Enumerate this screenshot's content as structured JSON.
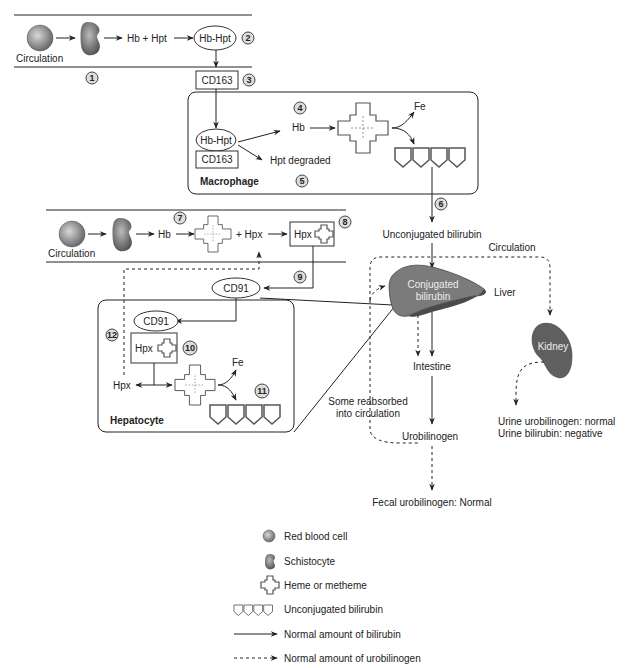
{
  "top_pathway": {
    "circulation_label": "Circulation",
    "hb_hpt": "Hb + Hpt",
    "complex": "Hb-Hpt",
    "receptor": "CD163",
    "steps": [
      "1",
      "2",
      "3"
    ]
  },
  "macrophage": {
    "title": "Macrophage",
    "complex": "Hb-Hpt",
    "receptor": "CD163",
    "hb": "Hb",
    "hpt_degraded": "Hpt degraded",
    "fe": "Fe",
    "steps": [
      "4",
      "5",
      "6"
    ]
  },
  "bottom_pathway": {
    "circulation_label": "Circulation",
    "hb": "Hb",
    "plus_hpx": "+ Hpx",
    "complex_hpx": "Hpx",
    "receptor": "CD91",
    "steps": [
      "7",
      "8",
      "9"
    ]
  },
  "hepatocyte": {
    "title": "Hepatocyte",
    "receptor": "CD91",
    "complex_hpx": "Hpx",
    "hpx": "Hpx",
    "fe": "Fe",
    "steps": [
      "10",
      "11",
      "12"
    ]
  },
  "liver_flow": {
    "unconjugated": "Unconjugated bilirubin",
    "circulation": "Circulation",
    "conjugated_line1": "Conjugated",
    "conjugated_line2": "bilirubin",
    "liver": "Liver",
    "intestine": "Intestine",
    "reabsorbed_line1": "Some reabsorbed",
    "reabsorbed_line2": "into circulation",
    "urobilinogen": "Urobilinogen",
    "fecal": "Fecal urobilinogen: Normal",
    "kidney": "Kidney",
    "urine_urobilinogen": "Urine urobilinogen: normal",
    "urine_bilirubin": "Urine bilirubin: negative"
  },
  "legend": {
    "items": [
      {
        "icon": "red-blood-cell-icon",
        "label": "Red blood cell"
      },
      {
        "icon": "schistocyte-icon",
        "label": "Schistocyte"
      },
      {
        "icon": "heme-icon",
        "label": "Heme or metheme"
      },
      {
        "icon": "unconjugated-bilirubin-icon",
        "label": "Unconjugated bilirubin"
      },
      {
        "icon": "solid-arrow-icon",
        "label": "Normal amount of bilirubin"
      },
      {
        "icon": "dashed-arrow-icon",
        "label": "Normal amount of urobilinogen"
      }
    ]
  },
  "colors": {
    "liver_light": "#7a7a7a",
    "liver_dark": "#4e4e4e",
    "kidney": "#5e5e5e",
    "cell": "#8a8a8a"
  }
}
